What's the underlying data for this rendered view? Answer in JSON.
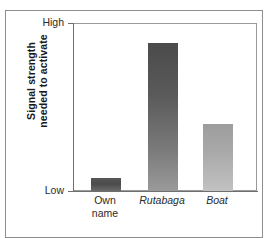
{
  "chart_data": {
    "type": "bar",
    "title": "",
    "subtitle": "",
    "xlabel": "",
    "ylabel": "Signal strength needed to activate",
    "ylabel_line1": "Signal strength",
    "ylabel_line2": "needed to activate",
    "categories": [
      "Own name",
      "Rutabaga",
      "Boat"
    ],
    "category_lines": [
      [
        "Own",
        "name"
      ],
      [
        "Rutabaga"
      ],
      [
        "Boat"
      ]
    ],
    "category_styles": [
      "normal",
      "italic",
      "italic"
    ],
    "values": [
      8,
      88.5,
      40
    ],
    "ylim": [
      0,
      100
    ],
    "ytick_labels": [
      "Low",
      "High"
    ],
    "ytick_values": [
      0,
      100
    ],
    "grid": false,
    "legend": null,
    "bar_colors": [
      "#4a4a4a",
      "#5a5a5a",
      "#a8a8a8"
    ]
  },
  "axis": {
    "y_high_label": "High",
    "y_low_label": "Low"
  }
}
